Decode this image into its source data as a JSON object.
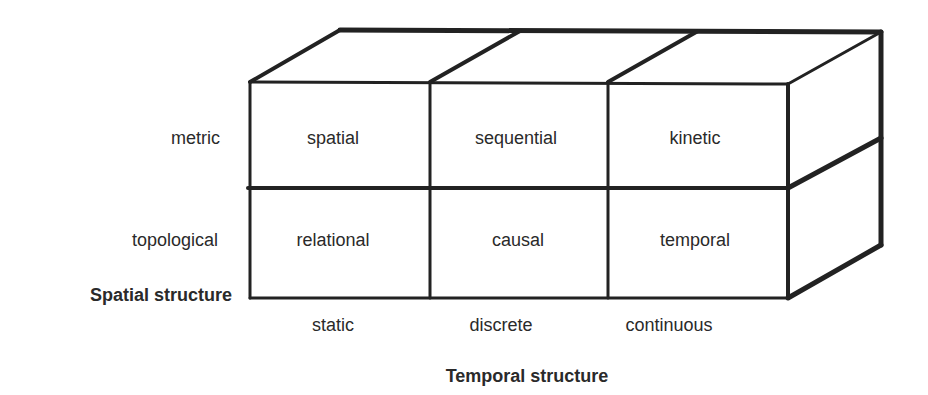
{
  "diagram": {
    "type": "3x2 cube matrix",
    "cells": [
      {
        "row": "metric",
        "col": "static",
        "label": "spatial"
      },
      {
        "row": "metric",
        "col": "discrete",
        "label": "sequential"
      },
      {
        "row": "metric",
        "col": "continuous",
        "label": "kinetic"
      },
      {
        "row": "topological",
        "col": "static",
        "label": "relational"
      },
      {
        "row": "topological",
        "col": "discrete",
        "label": "causal"
      },
      {
        "row": "topological",
        "col": "continuous",
        "label": "temporal"
      }
    ],
    "rows": [
      "metric",
      "topological"
    ],
    "columns": [
      "static",
      "discrete",
      "continuous"
    ],
    "row_axis_title": "Spatial structure",
    "column_axis_title": "Temporal structure",
    "stroke_color": "#222222"
  }
}
